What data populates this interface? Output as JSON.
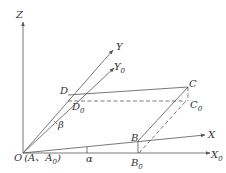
{
  "diagram": {
    "title": "",
    "axes": {
      "z": {
        "label": "Z"
      },
      "y": {
        "label": "Y"
      },
      "y0": {
        "label": "Y",
        "sub": "0"
      },
      "x": {
        "label": "X"
      },
      "x0": {
        "label": "X",
        "sub": "0"
      }
    },
    "points": {
      "origin": {
        "label": "O",
        "extra": "(A、A",
        "extra_sub": "0",
        "extra_close": ")"
      },
      "B": {
        "label": "B"
      },
      "B0": {
        "label": "B",
        "sub": "0"
      },
      "C": {
        "label": "C"
      },
      "C0": {
        "label": "C",
        "sub": "0"
      },
      "D": {
        "label": "D"
      },
      "D0": {
        "label": "D",
        "sub": "0"
      }
    },
    "angles": {
      "alpha": {
        "label": "α"
      },
      "beta": {
        "label": "β"
      }
    },
    "colors": {
      "line": "#555555",
      "text": "#333333",
      "background": "#ffffff"
    }
  }
}
